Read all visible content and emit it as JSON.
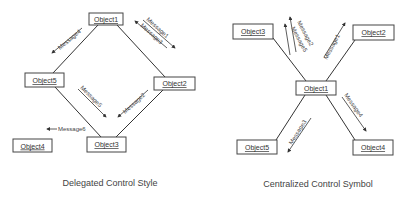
{
  "delegated": {
    "caption": "Delegated Control Style",
    "objects": {
      "o1": "Object1",
      "o2": "Object2",
      "o3": "Object3",
      "o4": "Object4",
      "o5": "Object5"
    },
    "messages": {
      "m1": "Message1",
      "m2": "Message2",
      "m3": "Message3",
      "m4": "Message4",
      "m5": "Message5",
      "m6": "Message6"
    }
  },
  "centralized": {
    "caption": "Centralized Control Symbol",
    "objects": {
      "o1": "Object1",
      "o2": "Object2",
      "o3": "Object3",
      "o4": "Object4",
      "o5": "Object5"
    },
    "messages": {
      "m1": "Message1",
      "m2": "Message2",
      "m3": "Message3",
      "m4": "Message4",
      "m5": "Message5"
    }
  }
}
